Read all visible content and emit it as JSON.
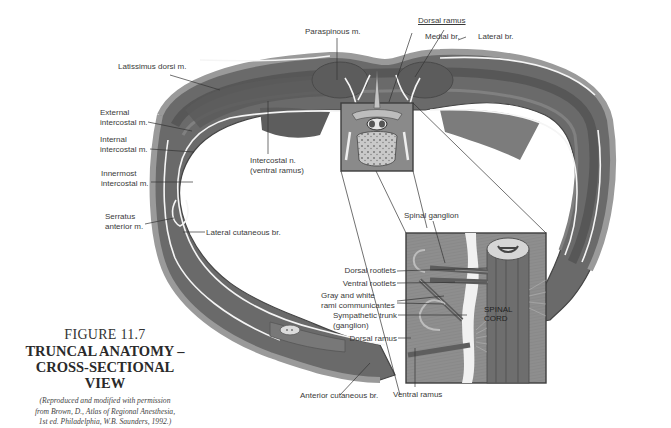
{
  "figure": {
    "number": "FIGURE 11.7",
    "title_line1": "TRUNCAL ANATOMY –",
    "title_line2": "CROSS-SECTIONAL VIEW",
    "credit_line1": "(Reproduced and modified with permission",
    "credit_line2": "from Brown, D., Atlas of Regional Anesthesia,",
    "credit_line3": "1st ed. Philadelphia, W.B. Saunders, 1992.)"
  },
  "labels": {
    "paraspinous": "Paraspinous m.",
    "dorsal_ramus_top": "Dorsal ramus",
    "medial_br": "Medial br.",
    "lateral_br": "Lateral br.",
    "latissimus": "Latissimus dorsi m.",
    "external_ic_1": "External",
    "external_ic_2": "intercostal m.",
    "internal_ic_1": "Internal",
    "internal_ic_2": "intercostal m.",
    "innermost_ic_1": "Innermost",
    "innermost_ic_2": "intercostal m.",
    "intercostal_n_1": "Intercostal n.",
    "intercostal_n_2": "(ventral ramus)",
    "serratus_1": "Serratus",
    "serratus_2": "anterior m.",
    "lateral_cutaneous": "Lateral cutaneous br.",
    "spinal_ganglion": "Spinal ganglion",
    "dorsal_rootlets": "Dorsal rootlets",
    "ventral_rootlets": "Ventral rootlets",
    "rami_1": "Gray and white",
    "rami_2": "rami communicantes",
    "symp_1": "Sympathetic trunk",
    "symp_2": "(ganglion)",
    "dorsal_ramus_inset": "Dorsal ramus",
    "anterior_cutaneous": "Anterior cutaneous br.",
    "ventral_ramus": "Ventral ramus",
    "spinal_cord_1": "SPINAL",
    "spinal_cord_2": "CORD"
  },
  "colors": {
    "muscle_dark": "#5e5e5e",
    "muscle_mid": "#7a7a7a",
    "skin": "#9a9a9a",
    "nerve": "#f4f4f4",
    "inset_bg": "#8c8c8c",
    "leader": "#333333"
  }
}
